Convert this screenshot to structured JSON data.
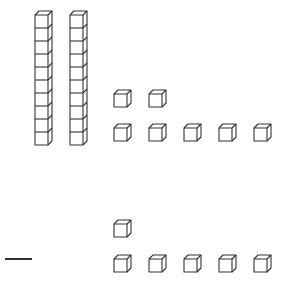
{
  "diagram": {
    "type": "base-ten-blocks",
    "line_color": "#333333",
    "background": "#ffffff",
    "top_group": {
      "tens_rods": 2,
      "units_row1": 2,
      "units_row2": 5,
      "value": 27
    },
    "operator": {
      "symbol": "minus",
      "glyph": "−"
    },
    "bottom_group": {
      "units_row1": 1,
      "units_row2": 5,
      "value": 6
    }
  }
}
